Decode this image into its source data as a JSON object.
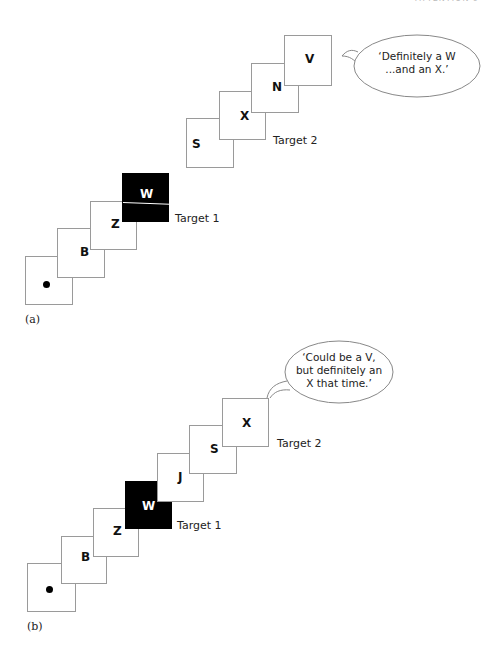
{
  "header": {
    "text": "ATTENTION 9"
  },
  "panel_a": {
    "label": "(a)",
    "cards": [
      {
        "id": "fixation",
        "content": "dot",
        "left": 25,
        "top": 256,
        "w": 48,
        "h": 49
      },
      {
        "id": "B",
        "letter": "B",
        "left": 57,
        "top": 228,
        "w": 48,
        "h": 50
      },
      {
        "id": "Z",
        "letter": "Z",
        "left": 90,
        "top": 201,
        "w": 47,
        "h": 49
      },
      {
        "id": "W",
        "letter": "W",
        "left": 122,
        "top": 173,
        "w": 47,
        "h": 49,
        "target": true
      },
      {
        "id": "S",
        "letter": "S",
        "left": 186,
        "top": 118,
        "w": 48,
        "h": 50
      },
      {
        "id": "X",
        "letter": "X",
        "left": 219,
        "top": 91,
        "w": 47,
        "h": 49
      },
      {
        "id": "N",
        "letter": "N",
        "left": 251,
        "top": 63,
        "w": 48,
        "h": 50
      },
      {
        "id": "V",
        "letter": "V",
        "left": 284,
        "top": 35,
        "w": 48,
        "h": 51
      }
    ],
    "target1_label": "Target 1",
    "target2_label": "Target 2",
    "speech": {
      "line1": "‘Definitely a W",
      "line2": "...and an X.’"
    }
  },
  "panel_b": {
    "label": "(b)",
    "cards": [
      {
        "id": "fixation",
        "content": "dot",
        "left": 27,
        "top": 563,
        "w": 49,
        "h": 49
      },
      {
        "id": "B",
        "letter": "B",
        "left": 61,
        "top": 536,
        "w": 46,
        "h": 48
      },
      {
        "id": "Z",
        "letter": "Z",
        "left": 93,
        "top": 508,
        "w": 46,
        "h": 49
      },
      {
        "id": "W",
        "letter": "W",
        "left": 125,
        "top": 481,
        "w": 47,
        "h": 48,
        "target": true
      },
      {
        "id": "J",
        "letter": "J",
        "left": 157,
        "top": 453,
        "w": 47,
        "h": 49
      },
      {
        "id": "S",
        "letter": "S",
        "left": 189,
        "top": 425,
        "w": 48,
        "h": 49
      },
      {
        "id": "X",
        "letter": "X",
        "left": 222,
        "top": 398,
        "w": 47,
        "h": 49
      }
    ],
    "target1_label": "Target 1",
    "target2_label": "Target 2",
    "speech": {
      "line1": "‘Could be a V,",
      "line2": "but definitely an",
      "line3": "X that time.’"
    }
  },
  "colors": {
    "card_border": "#9a9a9a",
    "target_fill": "#000000",
    "text": "#111111"
  }
}
